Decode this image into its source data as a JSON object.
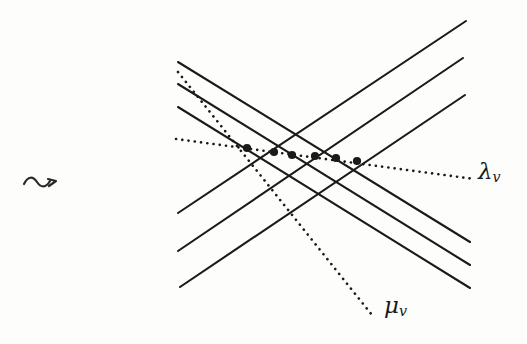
{
  "figure": {
    "kind": "line-arrangement-diagram",
    "background_color": "#fdfdfc",
    "stroke_color": "#1a1a1a",
    "width": 527,
    "height": 344
  },
  "annotations": {
    "squiggle_arrow": {
      "glyph": "rightsquigarrow",
      "x": 22,
      "y": 168
    },
    "lambda_label": {
      "base": "λ",
      "subscript": "v",
      "full": "λv",
      "x": 478,
      "y": 160
    },
    "mu_label": {
      "base": "μ",
      "subscript": "v",
      "full": "μv",
      "x": 384,
      "y": 294
    }
  },
  "chart_data": {
    "type": "line",
    "title": "",
    "xlabel": "",
    "ylabel": "",
    "xlim": [
      0,
      527
    ],
    "ylim": [
      344,
      0
    ],
    "grid": false,
    "legend_position": "inline-right",
    "coordinate_note": "pixel coordinates, y increases downward",
    "series": [
      {
        "name": "descending-solid-1",
        "style": "solid",
        "width": 2.1,
        "points": [
          [
            178,
            62
          ],
          [
            470,
            242
          ]
        ]
      },
      {
        "name": "descending-solid-2",
        "style": "solid",
        "width": 2.1,
        "points": [
          [
            178,
            84
          ],
          [
            470,
            265
          ]
        ]
      },
      {
        "name": "descending-solid-3",
        "style": "solid",
        "width": 2.1,
        "points": [
          [
            178,
            107
          ],
          [
            470,
            288
          ]
        ]
      },
      {
        "name": "ascending-solid-1",
        "style": "solid",
        "width": 2.1,
        "points": [
          [
            178,
            213
          ],
          [
            466,
            21
          ]
        ]
      },
      {
        "name": "ascending-solid-2",
        "style": "solid",
        "width": 2.1,
        "points": [
          [
            178,
            251
          ],
          [
            463,
            58
          ]
        ]
      },
      {
        "name": "ascending-solid-3",
        "style": "solid",
        "width": 2.1,
        "points": [
          [
            180,
            287
          ],
          [
            465,
            95
          ]
        ]
      },
      {
        "name": "lambda-v-dotted",
        "style": "dotted",
        "width": 2.6,
        "label": "λv",
        "points": [
          [
            176,
            139
          ],
          [
            474,
            179
          ]
        ]
      },
      {
        "name": "mu-v-dotted",
        "style": "dotted",
        "width": 2.6,
        "label": "μv",
        "points": [
          [
            178,
            72
          ],
          [
            372,
            315
          ]
        ]
      }
    ],
    "markers": {
      "name": "intersection-dots",
      "shape": "filled-circle",
      "radius": 4.1,
      "count": 6,
      "points": [
        [
          247,
          148
        ],
        [
          274,
          152
        ],
        [
          292,
          155
        ],
        [
          315,
          156
        ],
        [
          336,
          158
        ],
        [
          357,
          161
        ]
      ]
    }
  }
}
